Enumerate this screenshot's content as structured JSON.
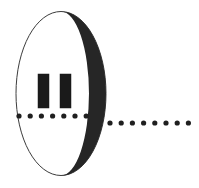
{
  "figure": {
    "kind": "double-slit-barrier-diagram",
    "canvas": {
      "width": 199,
      "height": 188,
      "background": "#ffffff"
    },
    "colors": {
      "ink": "#1a1a1a",
      "barrier_edge_dark": "#262626",
      "barrier_face": "#ffffff",
      "outline": "#3c3c3c",
      "dot": "#1f1f1f"
    },
    "barrier": {
      "name": "slit-barrier-disk",
      "shape": "ellipse",
      "center_x": 61,
      "center_y": 93.5,
      "radius_x": 45,
      "radius_y": 82,
      "outline_width": 1,
      "thickness_px": 17,
      "perspective": "viewed at an angle, showing the dark rim on the right side"
    },
    "slits": [
      {
        "name": "slit-left",
        "x": 38,
        "y": 74,
        "width": 11,
        "height": 34
      },
      {
        "name": "slit-right",
        "x": 60,
        "y": 74,
        "width": 11,
        "height": 34
      }
    ],
    "slit_count": 2,
    "dotted_path": {
      "name": "particle-trajectory",
      "dot_radius": 2.6,
      "segments": [
        {
          "name": "path-before-barrier",
          "side": "left",
          "y": 116,
          "start_x": 19,
          "spacing": 11.2,
          "count": 7
        },
        {
          "name": "path-after-barrier",
          "side": "right",
          "y": 123,
          "start_x": 110,
          "spacing": 11.2,
          "count": 8
        }
      ]
    },
    "labels": []
  }
}
